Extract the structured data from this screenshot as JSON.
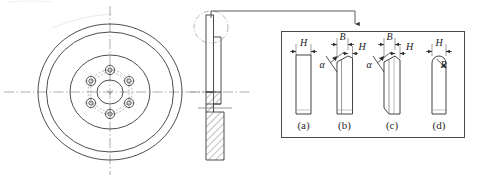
{
  "drawing": {
    "title": "Brake disc engineering drawing with groove-profile detail",
    "line_color": "#3a3a3a",
    "center_line_color": "#8a8a8a",
    "hatch_color": "#4a4a4a",
    "text_color": "#1a1a1a",
    "background": "#ffffff"
  },
  "front_view": {
    "name": "front-view-brake-disc",
    "center": {
      "cx": 110,
      "cy": 92
    },
    "outer_radius_x": 72,
    "outer_radius_y": 68,
    "rim_radius_x": 64,
    "rim_radius_y": 60,
    "hub_flange_radius_x": 40,
    "hub_flange_radius_y": 37,
    "bolt_circle_radius": 22,
    "bolt_hole_radius": 4.5,
    "bolt_hole_inner_radius": 2.2,
    "bore_radius_x": 13,
    "bore_radius_y": 12,
    "bolt_hole_count": 6,
    "bolt_hole_angles_deg": [
      90,
      30,
      -30,
      -90,
      -150,
      150
    ]
  },
  "side_view": {
    "name": "side-section-view",
    "callout_circle": {
      "cx": 211,
      "cy": 27,
      "rx": 17,
      "ry": 16
    },
    "leader": {
      "from_x": 211,
      "from_y": 11,
      "corner_x": 355,
      "corner_y": 11,
      "to_x": 355,
      "to_y": 28
    },
    "hatch_label": "section-hatching"
  },
  "detail_box": {
    "name": "detail-box-groove-profiles",
    "x": 281,
    "y": 31,
    "width": 184,
    "height": 107,
    "border_color": "#4a4a4a"
  },
  "profiles": [
    {
      "id": "a",
      "caption": "(a)",
      "shape": "rectangular-flat-groove",
      "dimensions": [
        {
          "symbol": "H",
          "kind": "width-arrow"
        }
      ],
      "angle_symbol": null,
      "radius_symbol": null
    },
    {
      "id": "b",
      "caption": "(b)",
      "shape": "single-bevel-groove",
      "dimensions": [
        {
          "symbol": "B",
          "kind": "width-arrow"
        },
        {
          "symbol": "H",
          "kind": "width-arrow"
        }
      ],
      "angle_symbol": "α",
      "radius_symbol": null
    },
    {
      "id": "c",
      "caption": "(c)",
      "shape": "double-bevel-groove",
      "dimensions": [
        {
          "symbol": "B",
          "kind": "width-arrow"
        },
        {
          "symbol": "H",
          "kind": "width-arrow"
        }
      ],
      "angle_symbol": "α",
      "radius_symbol": null
    },
    {
      "id": "d",
      "caption": "(d)",
      "shape": "round-bottom-groove",
      "dimensions": [
        {
          "symbol": "H",
          "kind": "width-arrow"
        }
      ],
      "angle_symbol": null,
      "radius_symbol": "R"
    }
  ],
  "labels": {
    "H": "H",
    "B": "B",
    "alpha": "α",
    "R": "R",
    "caption_a": "(a)",
    "caption_b": "(b)",
    "caption_c": "(c)",
    "caption_d": "(d)"
  }
}
